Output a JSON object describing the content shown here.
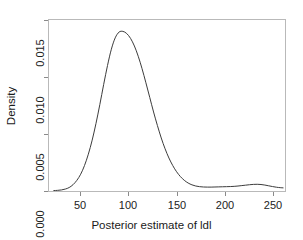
{
  "chart_data": {
    "type": "line",
    "title": "",
    "subtitle": "",
    "xlabel": "Posterior estimate of ldl",
    "ylabel": "Density",
    "xlim": [
      17,
      263
    ],
    "ylim": [
      0.0,
      0.0158
    ],
    "xticks": [
      50,
      100,
      150,
      200,
      250
    ],
    "xticklabels": [
      "50",
      "100",
      "150",
      "200",
      "250"
    ],
    "yticks": [
      0.0,
      0.005,
      0.01,
      0.015
    ],
    "yticklabels": [
      "0.000",
      "0.005",
      "0.010",
      "0.015"
    ],
    "grid": false,
    "legend": null,
    "annotations": [],
    "line_color": "#3c3c3c",
    "line_width": 1.0,
    "series": [
      {
        "name": "Posterior density of ldl",
        "x": [
          22,
          26,
          30,
          34,
          38,
          42,
          46,
          50,
          54,
          58,
          62,
          66,
          70,
          74,
          78,
          82,
          86,
          90,
          94,
          98,
          102,
          106,
          110,
          114,
          118,
          122,
          126,
          130,
          134,
          138,
          142,
          146,
          150,
          154,
          158,
          162,
          166,
          170,
          174,
          178,
          182,
          186,
          190,
          194,
          198,
          202,
          206,
          210,
          214,
          218,
          222,
          226,
          230,
          234,
          238,
          242,
          246,
          250,
          254,
          258,
          261
        ],
        "y": [
          4e-05,
          6e-05,
          0.0001,
          0.00018,
          0.00032,
          0.00058,
          0.00098,
          0.00155,
          0.00235,
          0.0034,
          0.0047,
          0.00625,
          0.008,
          0.00985,
          0.0116,
          0.0131,
          0.01415,
          0.01468,
          0.01475,
          0.01455,
          0.0141,
          0.0134,
          0.01245,
          0.0113,
          0.01,
          0.00865,
          0.0073,
          0.00605,
          0.0049,
          0.0039,
          0.00305,
          0.00235,
          0.00178,
          0.00133,
          0.00099,
          0.00074,
          0.00057,
          0.00046,
          0.0004,
          0.00037,
          0.00036,
          0.00036,
          0.00037,
          0.00038,
          0.00039,
          0.0004,
          0.00041,
          0.00043,
          0.00046,
          0.0005,
          0.00054,
          0.00058,
          0.00061,
          0.00062,
          0.0006,
          0.00055,
          0.00048,
          0.00041,
          0.00035,
          0.00031,
          0.00029
        ]
      }
    ],
    "peak": {
      "x": 95,
      "y": 0.01475
    }
  }
}
